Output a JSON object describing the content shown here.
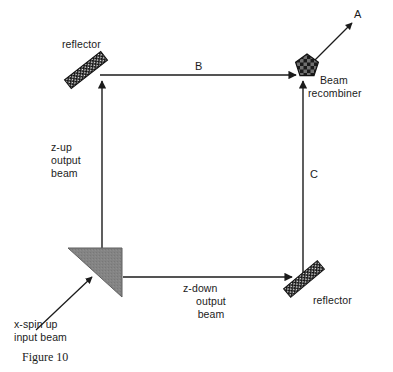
{
  "figure": {
    "caption": "Figure 10",
    "background_color": "#ffffff",
    "ink_color": "#1b1b1b",
    "splitter_fill": "#808080",
    "reflector_fill": "#161616",
    "recombiner_fill": "#1a1a1a"
  },
  "labels": {
    "reflector_top": "reflector",
    "reflector_bottom": "reflector",
    "beam_recombiner_line1": "Beam",
    "beam_recombiner_line2": "recombiner",
    "z_up_line1": "z-up",
    "z_up_line2": "output",
    "z_up_line3": "beam",
    "z_down_line1": "z-down",
    "z_down_line2": "output",
    "z_down_line3": "beam",
    "input_line1": "x-spin up",
    "input_line2": "input beam",
    "path_a": "A",
    "path_b": "B",
    "path_c": "C"
  },
  "components": {
    "beam_splitter": "beam-splitter-triangle",
    "reflector_top_left": "reflector-bar",
    "reflector_bottom_right": "reflector-bar",
    "beam_recombiner": "pentagon-checkered"
  },
  "beams": {
    "input": "x-spin up input beam",
    "up": "z-up output beam",
    "top": "B",
    "right": "C",
    "bottom": "z-down output beam",
    "output": "A"
  }
}
